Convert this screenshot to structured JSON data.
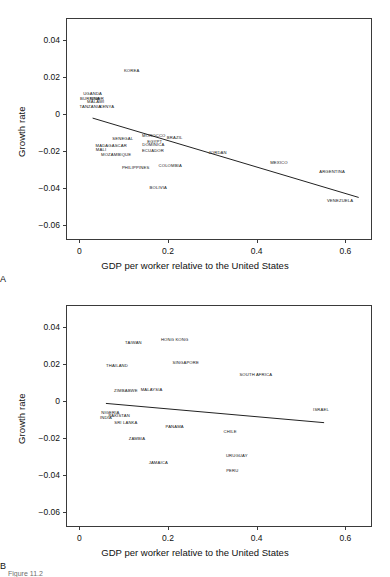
{
  "figure": {
    "caption": "Figure 11.2",
    "panels": [
      "A",
      "B"
    ]
  },
  "chart_data": [
    {
      "type": "scatter",
      "panel": "A",
      "title": "",
      "xlabel": "GDP per worker relative to the United States",
      "ylabel": "Growth rate",
      "xlim": [
        -0.03,
        0.66
      ],
      "ylim": [
        -0.068,
        0.052
      ],
      "xticks": [
        0,
        0.2,
        0.4,
        0.6
      ],
      "xticklabels": [
        "0",
        "0.2",
        "0.4",
        "0.6"
      ],
      "yticks": [
        0.04,
        0.02,
        0,
        -0.02,
        -0.04,
        -0.06
      ],
      "yticklabels": [
        "0.04",
        "0.02",
        "0",
        "−0.02",
        "−0.04",
        "−0.06"
      ],
      "grid": false,
      "legend": "none",
      "marker_style": "text-label-only",
      "points": [
        {
          "label": "KOREA",
          "x": 0.118,
          "y": 0.0238
        },
        {
          "label": "UGANDA",
          "x": 0.03,
          "y": 0.0113
        },
        {
          "label": "BURKINA",
          "x": 0.024,
          "y": 0.009
        },
        {
          "label": "NIGER",
          "x": 0.04,
          "y": 0.0086
        },
        {
          "label": "MALAWI",
          "x": 0.037,
          "y": 0.007
        },
        {
          "label": "TANZANIA",
          "x": 0.025,
          "y": 0.0046
        },
        {
          "label": "KENYA",
          "x": 0.062,
          "y": 0.0042
        },
        {
          "label": "SENEGAL",
          "x": 0.098,
          "y": -0.0131
        },
        {
          "label": "MOROCCO",
          "x": 0.168,
          "y": -0.0112
        },
        {
          "label": "BRAZIL",
          "x": 0.215,
          "y": -0.0125
        },
        {
          "label": "EGYPT",
          "x": 0.17,
          "y": -0.0146
        },
        {
          "label": "DOMINICA",
          "x": 0.167,
          "y": -0.0163
        },
        {
          "label": "MADAGASCAR",
          "x": 0.072,
          "y": -0.0166
        },
        {
          "label": "MALI",
          "x": 0.049,
          "y": -0.0189
        },
        {
          "label": "ECUADOR",
          "x": 0.166,
          "y": -0.0196
        },
        {
          "label": "JORDAN",
          "x": 0.312,
          "y": -0.0206
        },
        {
          "label": "MOZAMBIQUE",
          "x": 0.083,
          "y": -0.0213
        },
        {
          "label": "MEXICO",
          "x": 0.45,
          "y": -0.0261
        },
        {
          "label": "PHILIPPINES",
          "x": 0.127,
          "y": -0.0283
        },
        {
          "label": "COLOMBIA",
          "x": 0.205,
          "y": -0.0276
        },
        {
          "label": "ARGENTINA",
          "x": 0.57,
          "y": -0.0306
        },
        {
          "label": "BOLIVIA",
          "x": 0.178,
          "y": -0.0394
        },
        {
          "label": "VENEZUELA",
          "x": 0.588,
          "y": -0.0463
        }
      ],
      "fit_line": {
        "x0": 0.03,
        "y0": -0.0021,
        "x1": 0.63,
        "y1": -0.045
      }
    },
    {
      "type": "scatter",
      "panel": "B",
      "title": "",
      "xlabel": "GDP per worker relative to the United States",
      "ylabel": "Growth rate",
      "xlim": [
        -0.03,
        0.66
      ],
      "ylim": [
        -0.068,
        0.052
      ],
      "xticks": [
        0,
        0.2,
        0.4,
        0.6
      ],
      "xticklabels": [
        "0",
        "0.2",
        "0.4",
        "0.6"
      ],
      "yticks": [
        0.04,
        0.02,
        0,
        -0.02,
        -0.04,
        -0.06
      ],
      "yticklabels": [
        "0.04",
        "0.02",
        "0",
        "−0.02",
        "−0.04",
        "−0.06"
      ],
      "grid": false,
      "legend": "none",
      "marker_style": "text-label-only",
      "points": [
        {
          "label": "TAIWAN",
          "x": 0.122,
          "y": 0.0318
        },
        {
          "label": "HONG KONG",
          "x": 0.215,
          "y": 0.0335
        },
        {
          "label": "SINGAPORE",
          "x": 0.24,
          "y": 0.0212
        },
        {
          "label": "THAILAND",
          "x": 0.085,
          "y": 0.0195
        },
        {
          "label": "SOUTH AFRICA",
          "x": 0.398,
          "y": 0.0146
        },
        {
          "label": "ZIMBABWE",
          "x": 0.105,
          "y": 0.006
        },
        {
          "label": "MALAYSIA",
          "x": 0.163,
          "y": 0.0066
        },
        {
          "label": "ISRAEL",
          "x": 0.545,
          "y": -0.0042
        },
        {
          "label": "NIGERIA",
          "x": 0.07,
          "y": -0.0059
        },
        {
          "label": "PAKISTAN",
          "x": 0.09,
          "y": -0.0074
        },
        {
          "label": "INDIA",
          "x": 0.06,
          "y": -0.0086
        },
        {
          "label": "SRI LANKA",
          "x": 0.105,
          "y": -0.0114
        },
        {
          "label": "PANAMA",
          "x": 0.215,
          "y": -0.0132
        },
        {
          "label": "CHILE",
          "x": 0.34,
          "y": -0.0163
        },
        {
          "label": "ZAMBIA",
          "x": 0.13,
          "y": -0.0199
        },
        {
          "label": "URUGUAY",
          "x": 0.355,
          "y": -0.0293
        },
        {
          "label": "JAMAICA",
          "x": 0.178,
          "y": -0.0328
        },
        {
          "label": "PERU",
          "x": 0.345,
          "y": -0.037
        }
      ],
      "fit_line": {
        "x0": 0.06,
        "y0": -0.0012,
        "x1": 0.552,
        "y1": -0.0116
      }
    }
  ]
}
